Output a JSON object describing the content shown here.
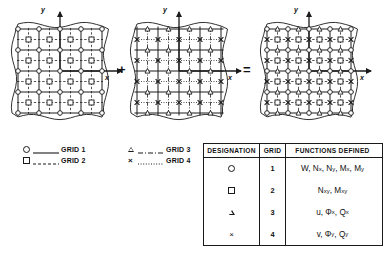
{
  "figure": {
    "type": "grid-superposition-diagram",
    "operators": {
      "plus": "+",
      "equals": "="
    },
    "panels": [
      {
        "name": "panel-left",
        "axis_x_label": "x",
        "axis_y_label": "y",
        "grids_shown": [
          1,
          2
        ],
        "markers": [
          "circle",
          "square"
        ],
        "cells": 4
      },
      {
        "name": "panel-middle",
        "axis_x_label": "x",
        "axis_y_label": "y",
        "grids_shown": [
          3,
          4
        ],
        "markers": [
          "triangle",
          "cross"
        ],
        "cells": 4
      },
      {
        "name": "panel-right",
        "axis_x_label": "x",
        "axis_y_label": "y",
        "grids_shown": [
          1,
          2,
          3,
          4
        ],
        "markers": [
          "circle",
          "square",
          "triangle",
          "cross"
        ],
        "cells": 4
      }
    ]
  },
  "legend": {
    "group_left": [
      {
        "marker": "circle",
        "line_style": "solid",
        "label": "GRID 1"
      },
      {
        "marker": "square",
        "line_style": "dashed",
        "label": "GRID 2"
      }
    ],
    "group_right": [
      {
        "marker": "triangle",
        "line_style": "dash-dot",
        "label": "GRID 3"
      },
      {
        "marker": "cross",
        "line_style": "dotted",
        "label": "GRID 4"
      }
    ]
  },
  "table": {
    "headers": [
      "DESIGNATION",
      "GRID",
      "FUNCTIONS DEFINED"
    ],
    "rows": [
      {
        "designation": "circle",
        "grid": "1",
        "functions_plain": "W, Nx, Ny, Mx, My",
        "functions": [
          {
            "base": "W",
            "sub": ""
          },
          {
            "base": "N",
            "sub": "x"
          },
          {
            "base": "N",
            "sub": "y"
          },
          {
            "base": "M",
            "sub": "x"
          },
          {
            "base": "M",
            "sub": "y"
          }
        ]
      },
      {
        "designation": "square",
        "grid": "2",
        "functions_plain": "Nxy , Mxy",
        "functions": [
          {
            "base": "N",
            "sub": "xy"
          },
          {
            "base": "M",
            "sub": "xy"
          }
        ]
      },
      {
        "designation": "triangle",
        "grid": "3",
        "functions_plain": "u, Φx, Qx",
        "functions": [
          {
            "base": "u",
            "sub": ""
          },
          {
            "base": "Φ",
            "sub": "x"
          },
          {
            "base": "Q",
            "sub": "x"
          }
        ]
      },
      {
        "designation": "cross",
        "grid": "4",
        "functions_plain": "v, Φy, Qy",
        "functions": [
          {
            "base": "v",
            "sub": ""
          },
          {
            "base": "Φ",
            "sub": "y"
          },
          {
            "base": "Q",
            "sub": "y"
          }
        ]
      }
    ]
  },
  "colors": {
    "ink": "#1a1a1a",
    "background": "#ffffff"
  }
}
